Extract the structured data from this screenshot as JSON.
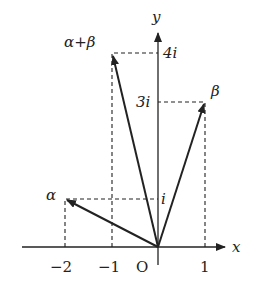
{
  "diagram": {
    "axes": {
      "x_label": "x",
      "y_label": "y",
      "origin_label": "O"
    },
    "x_ticks": [
      "−2",
      "−1",
      "1"
    ],
    "y_ticks": [
      "i",
      "3i",
      "4i"
    ],
    "vectors": [
      {
        "name": "α",
        "point": [
          -2,
          1
        ]
      },
      {
        "name": "β",
        "point": [
          1,
          3
        ]
      },
      {
        "name": "α+β",
        "point": [
          -1,
          4
        ]
      }
    ],
    "colors": {
      "stroke": "#222222",
      "background": "#ffffff"
    }
  }
}
